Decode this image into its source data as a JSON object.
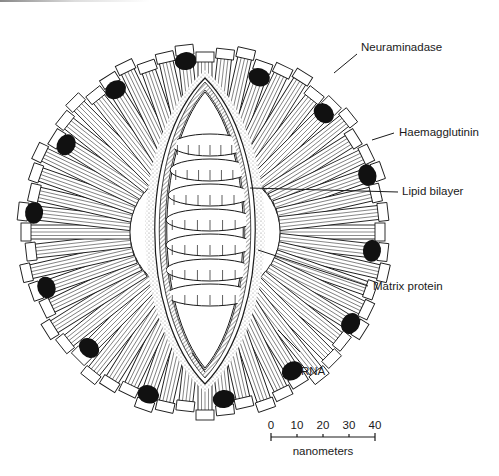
{
  "figure": {
    "colors": {
      "ink": "#1a1a1a",
      "background": "#ffffff",
      "stipple": "#9a9a9a"
    }
  },
  "labels": [
    {
      "id": "neuraminidase",
      "text": "Neuraminadase"
    },
    {
      "id": "haemagglutinin",
      "text": "Haemagglutinin"
    },
    {
      "id": "lipid-bilayer",
      "text": "Lipid bilayer"
    },
    {
      "id": "matrix-protein",
      "text": "Matrix protein"
    },
    {
      "id": "rna",
      "text": "RNA"
    }
  ],
  "scale_bar": {
    "ticks": [
      "0",
      "10",
      "20",
      "30",
      "40"
    ],
    "unit": "nanometers",
    "min": 0,
    "max": 40
  }
}
